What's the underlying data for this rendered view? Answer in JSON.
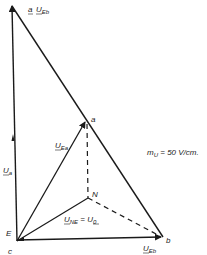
{
  "diagram": {
    "type": "phasor-diagram",
    "points": {
      "top": {
        "label": "a",
        "x": 12,
        "y": 4
      },
      "a": {
        "label": "a",
        "x": 86,
        "y": 121
      },
      "N": {
        "label": "N",
        "x": 88,
        "y": 198
      },
      "E": {
        "label": "E",
        "x": 17,
        "y": 241
      },
      "c": {
        "label": "c",
        "x": 17,
        "y": 241
      },
      "b": {
        "label": "b",
        "x": 163,
        "y": 237
      }
    },
    "labels": {
      "u_eb_top": "U",
      "u_eb_top_sub": "Eb",
      "a_top": "a",
      "u_eb_bottom": "U",
      "u_eb_bottom_sub": "Eb",
      "u_ea": "U",
      "u_ea_sub": "Ea",
      "u_a": "U",
      "u_a_sub": "a",
      "u_ne": "U",
      "u_ne_sub": "NE",
      "u_eq": " = U",
      "u_0_sub": "0",
      "point_a": "a",
      "point_N": "N",
      "point_E": "E",
      "point_c": "c",
      "point_b": "b",
      "scale": "m",
      "scale_sub": "U",
      "scale_value": " = 50 V/cm."
    },
    "line_color": "#1a1a1a"
  }
}
